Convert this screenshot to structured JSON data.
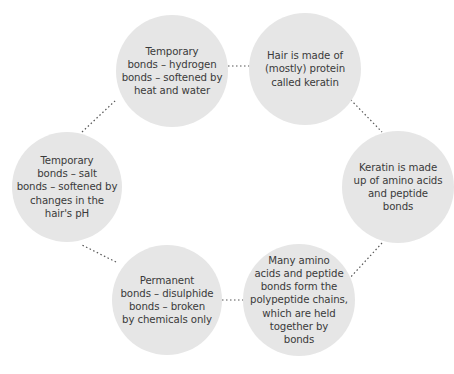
{
  "diagram": {
    "type": "cycle",
    "node_color": "#e6e6e6",
    "text_color": "#3a3a3a",
    "connector_color": "#555555",
    "connector_style": "dotted",
    "nodes": [
      {
        "id": "hair-keratin",
        "text": "Hair is made of\n(mostly) protein\ncalled keratin"
      },
      {
        "id": "keratin-amino",
        "text": "Keratin is made\nup of amino acids\nand peptide\nbonds"
      },
      {
        "id": "polypeptide-chains",
        "text": "Many amino\nacids and peptide\nbonds form the\npolypeptide chains,\nwhich are held\ntogether by\nbonds"
      },
      {
        "id": "disulphide-bonds",
        "text": "Permanent\nbonds – disulphide\nbonds – broken\nby chemicals only"
      },
      {
        "id": "salt-bonds",
        "text": "Temporary\nbonds – salt\nbonds – softened by\nchanges in the\nhair's pH"
      },
      {
        "id": "hydrogen-bonds",
        "text": "Temporary\nbonds – hydrogen\nbonds – softened by\nheat and water"
      }
    ]
  }
}
